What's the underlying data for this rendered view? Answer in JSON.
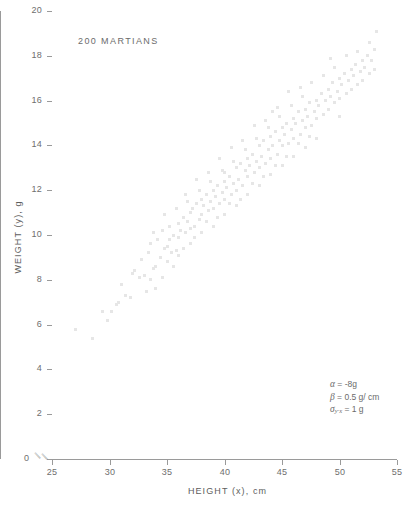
{
  "figure": {
    "width": 417,
    "height": 509,
    "background": "#ffffff",
    "point_color": "#e6e6e6",
    "axis_color": "#9a9a9a",
    "text_color": "#6b6b6b"
  },
  "annotation": "200 MARTIANS",
  "axes": {
    "x": {
      "title": "HEIGHT (x), cm",
      "ticks": [
        25,
        30,
        35,
        40,
        45,
        50,
        55
      ],
      "break_symbol": "//",
      "origin_label": "0"
    },
    "y": {
      "title": "WEIGHT (y), g",
      "ticks": [
        0,
        2,
        4,
        6,
        8,
        10,
        12,
        14,
        16,
        18,
        20
      ],
      "break_symbol": "//"
    }
  },
  "parameters": [
    {
      "symbol": "α",
      "subscript": "",
      "value": "= -8g"
    },
    {
      "symbol": "β",
      "subscript": "",
      "value": "= 0.5 g/ cm"
    },
    {
      "symbol": "σ",
      "subscript": "y·x",
      "value": "= 1 g"
    }
  ],
  "chart_data": {
    "type": "scatter",
    "title": "200 MARTIANS",
    "xlabel": "HEIGHT (x), cm",
    "ylabel": "WEIGHT (y), g",
    "xlim": [
      25,
      55
    ],
    "ylim": [
      0,
      20
    ],
    "grid": false,
    "legend": null,
    "n_points": 200,
    "model": {
      "intercept_alpha": -8,
      "slope_beta": 0.5,
      "sigma_y_given_x": 1,
      "equation": "y = -8 + 0.5x"
    },
    "points": [
      [
        27.0,
        5.8
      ],
      [
        28.5,
        5.4
      ],
      [
        29.4,
        6.6
      ],
      [
        30.2,
        6.6
      ],
      [
        30.6,
        6.9
      ],
      [
        31.4,
        7.3
      ],
      [
        31.8,
        7.2
      ],
      [
        32.0,
        8.3
      ],
      [
        32.2,
        8.4
      ],
      [
        32.6,
        8.1
      ],
      [
        33.0,
        8.2
      ],
      [
        33.2,
        7.5
      ],
      [
        33.6,
        8.0
      ],
      [
        33.8,
        8.5
      ],
      [
        34.0,
        8.6
      ],
      [
        34.0,
        7.6
      ],
      [
        34.4,
        9.0
      ],
      [
        34.6,
        8.1
      ],
      [
        34.8,
        9.4
      ],
      [
        35.0,
        9.5
      ],
      [
        35.0,
        8.8
      ],
      [
        35.2,
        9.8
      ],
      [
        35.4,
        9.2
      ],
      [
        35.6,
        10.0
      ],
      [
        35.8,
        9.3
      ],
      [
        36.0,
        10.5
      ],
      [
        36.0,
        9.9
      ],
      [
        36.0,
        9.1
      ],
      [
        36.2,
        10.2
      ],
      [
        36.4,
        10.8
      ],
      [
        36.6,
        10.1
      ],
      [
        36.8,
        10.6
      ],
      [
        37.0,
        11.0
      ],
      [
        37.0,
        10.3
      ],
      [
        37.0,
        9.6
      ],
      [
        37.2,
        11.2
      ],
      [
        37.4,
        10.4
      ],
      [
        37.6,
        11.4
      ],
      [
        37.8,
        10.7
      ],
      [
        38.0,
        11.6
      ],
      [
        38.0,
        10.9
      ],
      [
        38.0,
        10.1
      ],
      [
        38.2,
        11.3
      ],
      [
        38.4,
        11.8
      ],
      [
        38.6,
        11.1
      ],
      [
        38.8,
        11.5
      ],
      [
        39.0,
        12.0
      ],
      [
        39.0,
        11.2
      ],
      [
        39.0,
        10.4
      ],
      [
        39.2,
        11.7
      ],
      [
        39.4,
        12.2
      ],
      [
        39.6,
        11.4
      ],
      [
        39.8,
        11.9
      ],
      [
        40.0,
        12.4
      ],
      [
        40.0,
        11.6
      ],
      [
        40.0,
        10.9
      ],
      [
        40.0,
        12.8
      ],
      [
        40.2,
        12.1
      ],
      [
        40.4,
        12.6
      ],
      [
        40.6,
        11.8
      ],
      [
        40.8,
        12.3
      ],
      [
        41.0,
        13.0
      ],
      [
        41.0,
        12.0
      ],
      [
        41.0,
        11.3
      ],
      [
        41.2,
        12.5
      ],
      [
        41.4,
        13.2
      ],
      [
        41.6,
        12.2
      ],
      [
        41.8,
        12.9
      ],
      [
        42.0,
        13.4
      ],
      [
        42.0,
        12.6
      ],
      [
        42.0,
        11.8
      ],
      [
        42.2,
        13.1
      ],
      [
        42.4,
        13.6
      ],
      [
        42.6,
        12.8
      ],
      [
        42.8,
        13.3
      ],
      [
        43.0,
        14.0
      ],
      [
        43.0,
        13.0
      ],
      [
        43.0,
        12.2
      ],
      [
        43.2,
        13.5
      ],
      [
        43.4,
        14.2
      ],
      [
        43.6,
        13.2
      ],
      [
        43.8,
        13.8
      ],
      [
        44.0,
        14.4
      ],
      [
        44.0,
        13.4
      ],
      [
        44.0,
        12.7
      ],
      [
        44.2,
        14.0
      ],
      [
        44.4,
        14.6
      ],
      [
        44.6,
        13.6
      ],
      [
        44.8,
        14.2
      ],
      [
        45.0,
        14.8
      ],
      [
        45.0,
        14.0
      ],
      [
        45.0,
        13.1
      ],
      [
        45.2,
        14.5
      ],
      [
        45.4,
        15.0
      ],
      [
        45.6,
        14.1
      ],
      [
        45.8,
        14.7
      ],
      [
        46.0,
        15.2
      ],
      [
        46.0,
        14.3
      ],
      [
        46.0,
        13.5
      ],
      [
        46.2,
        15.0
      ],
      [
        46.4,
        15.5
      ],
      [
        46.6,
        14.5
      ],
      [
        46.8,
        15.1
      ],
      [
        47.0,
        15.6
      ],
      [
        47.0,
        14.8
      ],
      [
        47.0,
        13.9
      ],
      [
        47.2,
        15.3
      ],
      [
        47.4,
        15.9
      ],
      [
        47.6,
        14.9
      ],
      [
        47.8,
        15.5
      ],
      [
        48.0,
        16.0
      ],
      [
        48.0,
        15.2
      ],
      [
        48.0,
        14.3
      ],
      [
        48.2,
        15.8
      ],
      [
        48.4,
        16.3
      ],
      [
        48.6,
        15.4
      ],
      [
        48.8,
        16.0
      ],
      [
        49.0,
        16.5
      ],
      [
        49.0,
        15.6
      ],
      [
        49.2,
        16.2
      ],
      [
        49.4,
        16.8
      ],
      [
        49.6,
        15.9
      ],
      [
        49.8,
        16.4
      ],
      [
        50.0,
        17.0
      ],
      [
        50.0,
        16.1
      ],
      [
        50.0,
        15.3
      ],
      [
        50.2,
        16.7
      ],
      [
        50.4,
        17.2
      ],
      [
        50.6,
        16.3
      ],
      [
        50.8,
        16.9
      ],
      [
        51.0,
        17.4
      ],
      [
        51.0,
        16.5
      ],
      [
        51.2,
        17.1
      ],
      [
        51.4,
        17.6
      ],
      [
        51.6,
        16.7
      ],
      [
        51.8,
        17.3
      ],
      [
        52.0,
        17.8
      ],
      [
        52.0,
        16.9
      ],
      [
        52.2,
        17.5
      ],
      [
        52.4,
        18.0
      ],
      [
        52.6,
        17.2
      ],
      [
        52.8,
        17.8
      ],
      [
        53.0,
        18.3
      ],
      [
        53.0,
        17.4
      ],
      [
        53.2,
        19.1
      ],
      [
        33.4,
        9.2
      ],
      [
        34.2,
        9.8
      ],
      [
        35.6,
        8.6
      ],
      [
        36.4,
        9.4
      ],
      [
        37.4,
        9.9
      ],
      [
        38.4,
        10.6
      ],
      [
        39.4,
        10.8
      ],
      [
        40.4,
        11.4
      ],
      [
        41.4,
        11.6
      ],
      [
        42.4,
        12.3
      ],
      [
        43.4,
        12.6
      ],
      [
        44.4,
        13.1
      ],
      [
        45.4,
        13.5
      ],
      [
        46.4,
        14.1
      ],
      [
        47.4,
        14.4
      ],
      [
        36.8,
        11.5
      ],
      [
        37.8,
        12.0
      ],
      [
        38.8,
        12.4
      ],
      [
        39.8,
        12.9
      ],
      [
        40.8,
        13.3
      ],
      [
        41.8,
        13.8
      ],
      [
        42.8,
        14.3
      ],
      [
        43.8,
        14.8
      ],
      [
        44.8,
        15.3
      ],
      [
        45.8,
        15.8
      ],
      [
        46.8,
        16.2
      ],
      [
        31.0,
        7.8
      ],
      [
        32.8,
        8.9
      ],
      [
        34.6,
        10.2
      ],
      [
        33.6,
        9.6
      ],
      [
        35.2,
        10.4
      ],
      [
        36.6,
        11.8
      ],
      [
        38.6,
        12.8
      ],
      [
        39.6,
        13.4
      ],
      [
        41.6,
        14.2
      ],
      [
        43.6,
        15.1
      ],
      [
        44.6,
        15.7
      ],
      [
        45.6,
        16.4
      ],
      [
        48.6,
        17.1
      ],
      [
        49.6,
        17.5
      ],
      [
        50.6,
        18.0
      ],
      [
        47.6,
        16.8
      ],
      [
        42.6,
        14.9
      ],
      [
        40.6,
        13.9
      ],
      [
        37.6,
        12.5
      ],
      [
        35.8,
        11.2
      ],
      [
        34.8,
        10.9
      ],
      [
        33.8,
        10.1
      ],
      [
        30.8,
        7.0
      ],
      [
        29.8,
        6.2
      ],
      [
        51.6,
        18.2
      ],
      [
        52.6,
        18.6
      ],
      [
        49.2,
        17.9
      ],
      [
        46.6,
        16.6
      ],
      [
        44.2,
        15.5
      ]
    ]
  }
}
